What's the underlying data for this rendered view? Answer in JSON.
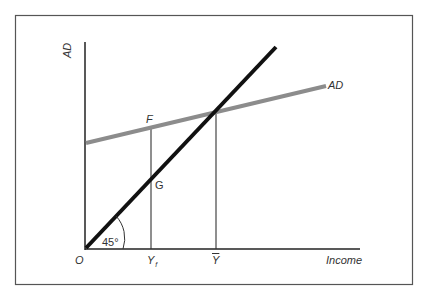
{
  "figure": {
    "frame_color": "#555555",
    "axes": {
      "y_label": "AD",
      "x_label": "Income",
      "origin_label": "O"
    },
    "lines": {
      "forty_five": {
        "label": "45°",
        "color": "#111111"
      },
      "ad": {
        "label": "AD",
        "color": "#8c8c8c"
      }
    },
    "points": {
      "F": "F",
      "G": "G"
    },
    "x_ticks": {
      "y_f": {
        "main": "Y",
        "sub": "f"
      },
      "y_bar": "Y"
    }
  }
}
